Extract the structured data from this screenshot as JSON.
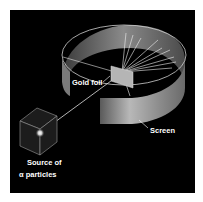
{
  "diagram": {
    "labels": {
      "gold_foil": "Gold foil",
      "screen": "Screen",
      "source_line1": "Source of",
      "source_line2": "α  particles"
    },
    "components": [
      "source-of-alpha-particles",
      "alpha-beam",
      "gold-foil",
      "circular-screen",
      "scattered-rays"
    ],
    "colors": {
      "background": "#000000",
      "screen": "#9a9a9a",
      "foil": "#b0b0b0",
      "rays": "#ffffff",
      "text": "#ffffff"
    }
  }
}
